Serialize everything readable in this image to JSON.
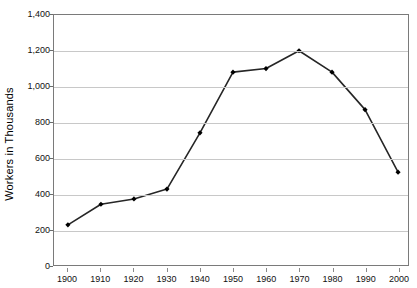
{
  "chart_data": {
    "type": "line",
    "title": "",
    "xlabel": "",
    "ylabel": "Workers in Thousands",
    "x": [
      1900,
      1910,
      1920,
      1930,
      1940,
      1950,
      1960,
      1970,
      1980,
      1990,
      2000
    ],
    "xtick_labels": [
      "1900",
      "1910",
      "1920",
      "1930",
      "1940",
      "1950",
      "1960",
      "1970",
      "1980",
      "1990",
      "2000"
    ],
    "values": [
      225,
      340,
      370,
      425,
      740,
      1080,
      1100,
      1200,
      1080,
      870,
      520
    ],
    "ytick_labels": [
      "0",
      "200",
      "400",
      "600",
      "800",
      "1,000",
      "1,200",
      "1,400"
    ],
    "ytick_values": [
      0,
      200,
      400,
      600,
      800,
      1000,
      1200,
      1400
    ],
    "ylim": [
      0,
      1400
    ],
    "xlim": [
      1900,
      2000
    ],
    "grid": "horizontal",
    "legend": "none",
    "series": [
      {
        "name": "Workers",
        "values": [
          225,
          340,
          370,
          425,
          740,
          1080,
          1100,
          1200,
          1080,
          870,
          520
        ]
      }
    ],
    "line_color": "#262626",
    "marker": "diamond",
    "marker_color": "#000000",
    "grid_color": "#c8c8c8",
    "axis_color": "#7a7a7a",
    "background": "#ffffff"
  }
}
